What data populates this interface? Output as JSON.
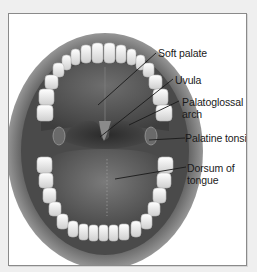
{
  "diagram": {
    "labels": [
      {
        "id": "soft-palate",
        "text": "Soft palate"
      },
      {
        "id": "uvula",
        "text": "Uvula"
      },
      {
        "id": "palatoglossal-arch",
        "text": "Palatoglossal\narch"
      },
      {
        "id": "palatine-tonsil",
        "text": "Palatine tonsil"
      },
      {
        "id": "dorsum-of-tongue",
        "text": "Dorsum of\ntongue"
      }
    ],
    "colors": {
      "background": "#efefef",
      "panel": "#ffffff",
      "border": "#8a8a8a",
      "text": "#1a1a1a",
      "leader_line": "#1a1a1a"
    }
  }
}
